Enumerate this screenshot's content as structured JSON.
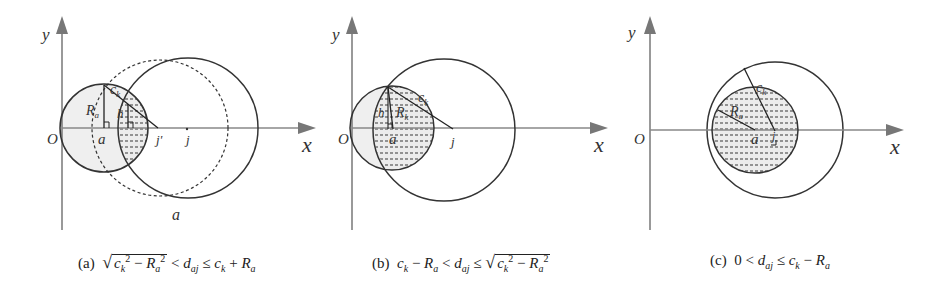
{
  "panels": [
    {
      "id": "a",
      "caption_label": "(a)",
      "caption_condition": "√(c_k² − R_a²) < d_aj ≤ c_k + R_a",
      "axis_labels": {
        "x": "x",
        "y": "y",
        "origin": "O"
      },
      "point_labels": [
        "a",
        "j'",
        "j",
        "a",
        "R_a",
        "h",
        "c_k"
      ]
    },
    {
      "id": "b",
      "caption_label": "(b)",
      "caption_condition": "c_k − R_a < d_aj ≤ √(c_k² − R_a²)",
      "axis_labels": {
        "x": "x",
        "y": "y",
        "origin": "O"
      },
      "point_labels": [
        "a",
        "j",
        "h",
        "R_a",
        "c_k"
      ]
    },
    {
      "id": "c",
      "caption_label": "(c)",
      "caption_condition": "0 < d_aj ≤ c_k − R_a",
      "axis_labels": {
        "x": "x",
        "y": "y",
        "origin": "O"
      },
      "point_labels": [
        "a",
        "j",
        "R_a",
        "c_k"
      ]
    }
  ],
  "labels": {
    "x": "x",
    "y": "y",
    "O": "O",
    "a": "a",
    "j": "j",
    "jp": "j'",
    "Ra": "R",
    "Ra_sub": "a",
    "ck": "c",
    "ck_sub": "k",
    "h": "h"
  },
  "captions": {
    "a_prefix": "(a)",
    "b_prefix": "(b)",
    "c_prefix": "(c)"
  },
  "colors": {
    "stroke": "#333333",
    "axis": "#777777",
    "fill_light": "#eeeeee",
    "hatch": "#555555"
  }
}
